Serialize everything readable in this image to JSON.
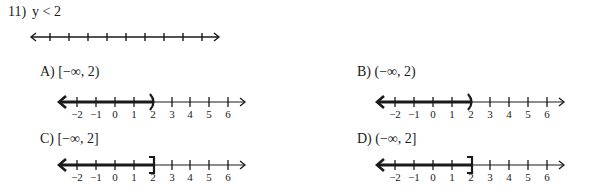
{
  "question": {
    "number": "11)",
    "inequality": "y < 2",
    "blank_number_line": {
      "tick_count": 9
    }
  },
  "choices": [
    {
      "letter": "A)",
      "interval": "[−∞, 2)",
      "endpoint": 2,
      "endpoint_symbol": "paren",
      "shaded": "left"
    },
    {
      "letter": "B)",
      "interval": "(−∞, 2)",
      "endpoint": 2,
      "endpoint_symbol": "paren",
      "shaded": "left"
    },
    {
      "letter": "C)",
      "interval": "[−∞, 2]",
      "endpoint": 2,
      "endpoint_symbol": "bracket",
      "shaded": "left"
    },
    {
      "letter": "D)",
      "interval": "(−∞, 2]",
      "endpoint": 2,
      "endpoint_symbol": "bracket",
      "shaded": "left"
    }
  ],
  "tick_labels": [
    "-2",
    "-1",
    "0",
    "1",
    "2",
    "3",
    "4",
    "5",
    "6"
  ]
}
